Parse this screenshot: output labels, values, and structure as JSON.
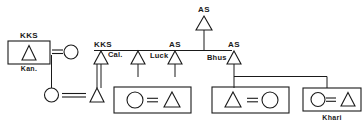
{
  "diagram": {
    "background_color": "#ffffff",
    "line_color": "#1a1a1a",
    "labels": {
      "ego_box_top": "KKS",
      "ego_box_bottom": "Kan.",
      "gen2_left_top": "KKS",
      "gen2_left_side": "Cal.",
      "gen2_mid_top": "AS",
      "gen2_mid_side": "Luck",
      "gen2_right_top": "AS",
      "gen2_right_side": "Bhus",
      "apex_top": "AS",
      "khari_box_bottom": "Khari"
    },
    "symbols": {
      "male": "triangle",
      "female": "circle",
      "marriage": "equals-sign",
      "household": "rectangle-enclosure"
    },
    "nodes": [
      {
        "id": "ego-household",
        "kind": "household-box",
        "members": [
          "triangle"
        ],
        "label_above": "KKS",
        "label_below": "Kan."
      },
      {
        "id": "ego-wife",
        "kind": "circle",
        "label": ""
      },
      {
        "id": "gen1-female",
        "kind": "circle",
        "label": ""
      },
      {
        "id": "gen2-son-a",
        "kind": "triangle",
        "label": ""
      },
      {
        "id": "gen2-cal",
        "kind": "triangle",
        "label_above": "KKS",
        "label_side": "Cal."
      },
      {
        "id": "gen2-plain",
        "kind": "triangle",
        "label": ""
      },
      {
        "id": "gen2-luck",
        "kind": "triangle",
        "label_above": "AS",
        "label_side": "Luck"
      },
      {
        "id": "gen2-bhus",
        "kind": "triangle",
        "label_above": "AS",
        "label_side": "Bhus"
      },
      {
        "id": "apex-as",
        "kind": "triangle",
        "label_above": "AS"
      },
      {
        "id": "household-1",
        "kind": "household-box",
        "members": [
          "circle",
          "equals",
          "triangle"
        ]
      },
      {
        "id": "household-2",
        "kind": "household-box",
        "members": [
          "triangle",
          "equals",
          "circle"
        ]
      },
      {
        "id": "household-khari",
        "kind": "household-box",
        "members": [
          "circle",
          "equals",
          "triangle"
        ],
        "label_below": "Khari"
      }
    ]
  }
}
